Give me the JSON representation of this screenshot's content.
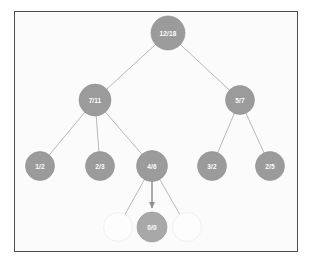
{
  "figure": {
    "kind": "tree-diagram",
    "background_color": "#fbfbfb",
    "frame_color": "#4d4d4d",
    "page_background": "#ffffff"
  },
  "style": {
    "node_fill": "#9b9b9b",
    "node_fill_highlight": "#a8a8a8",
    "node_stroke": "#8e8e8e",
    "ghost_fill": "#fdfdfd",
    "ghost_stroke": "#f0f0f0",
    "edge_color": "#b0b0b0",
    "arrow_color": "#8f8f8f",
    "label_color": "#ffffff"
  },
  "chart_data": {
    "type": "tree",
    "title": "",
    "nodes": [
      {
        "id": "root",
        "label": "12/18",
        "x": 168,
        "y": 33,
        "r": 17,
        "state": "filled",
        "level": 0
      },
      {
        "id": "l1a",
        "label": "7/11",
        "x": 95,
        "y": 100,
        "r": 16,
        "state": "filled",
        "level": 1
      },
      {
        "id": "l1b",
        "label": "5/7",
        "x": 240,
        "y": 100,
        "r": 14.5,
        "state": "filled",
        "level": 1
      },
      {
        "id": "l2a",
        "label": "1/2",
        "x": 40,
        "y": 166,
        "r": 14.5,
        "state": "filled",
        "level": 2
      },
      {
        "id": "l2b",
        "label": "2/3",
        "x": 100,
        "y": 166,
        "r": 14.5,
        "state": "filled",
        "level": 2
      },
      {
        "id": "l2c",
        "label": "4/6",
        "x": 152,
        "y": 166,
        "r": 15.5,
        "state": "filled",
        "level": 2
      },
      {
        "id": "l2d",
        "label": "3/2",
        "x": 212,
        "y": 166,
        "r": 14.5,
        "state": "filled",
        "level": 2
      },
      {
        "id": "l2e",
        "label": "2/5",
        "x": 270,
        "y": 166,
        "r": 14.5,
        "state": "filled",
        "level": 2
      },
      {
        "id": "l3a",
        "label": "",
        "x": 118,
        "y": 227,
        "r": 14.5,
        "state": "ghost",
        "level": 3
      },
      {
        "id": "l3b",
        "label": "0/0",
        "x": 152,
        "y": 227,
        "r": 15,
        "state": "highlight",
        "level": 3
      },
      {
        "id": "l3c",
        "label": "",
        "x": 187,
        "y": 227,
        "r": 14.5,
        "state": "ghost",
        "level": 3
      }
    ],
    "edges": [
      {
        "from": "root",
        "to": "l1a",
        "arrow": false
      },
      {
        "from": "root",
        "to": "l1b",
        "arrow": false
      },
      {
        "from": "l1a",
        "to": "l2a",
        "arrow": false
      },
      {
        "from": "l1a",
        "to": "l2b",
        "arrow": false
      },
      {
        "from": "l1a",
        "to": "l2c",
        "arrow": false
      },
      {
        "from": "l1b",
        "to": "l2d",
        "arrow": false
      },
      {
        "from": "l1b",
        "to": "l2e",
        "arrow": false
      },
      {
        "from": "l2c",
        "to": "l3a",
        "arrow": false
      },
      {
        "from": "l2c",
        "to": "l3b",
        "arrow": true
      },
      {
        "from": "l2c",
        "to": "l3c",
        "arrow": false
      }
    ]
  }
}
